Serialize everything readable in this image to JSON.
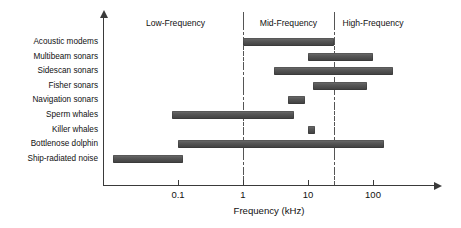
{
  "chart_data": {
    "type": "bar",
    "orientation": "horizontal",
    "title": "",
    "xlabel": "Frequency (kHz)",
    "ylabel": "",
    "xscale": "log",
    "xlim": [
      0.008,
      400
    ],
    "grid": false,
    "legend": null,
    "xticks": [
      0.1,
      1,
      10,
      100
    ],
    "xtick_labels": [
      "0.1",
      "1",
      "10",
      "100"
    ],
    "categories": [
      "Acoustic modems",
      "Multibeam sonars",
      "Sidescan sonars",
      "Fisher sonars",
      "Navigation sonars",
      "Sperm whales",
      "Killer whales",
      "Bottlenose dolphin",
      "Ship-radiated noise"
    ],
    "ranges": [
      {
        "label": "Acoustic modems",
        "start": 1.0,
        "end": 25.0
      },
      {
        "label": "Multibeam sonars",
        "start": 10.0,
        "end": 100.0
      },
      {
        "label": "Sidescan sonars",
        "start": 3.0,
        "end": 200.0
      },
      {
        "label": "Fisher sonars",
        "start": 12.0,
        "end": 80.0
      },
      {
        "label": "Navigation sonars",
        "start": 5.0,
        "end": 9.0
      },
      {
        "label": "Sperm whales",
        "start": 0.08,
        "end": 6.0
      },
      {
        "label": "Killer whales",
        "start": 10.0,
        "end": 13.0
      },
      {
        "label": "Bottlenose dolphin",
        "start": 0.1,
        "end": 150.0
      },
      {
        "label": "Ship-radiated noise",
        "start": 0.01,
        "end": 0.12
      }
    ],
    "bands": [
      {
        "label": "Low-Frequency",
        "start": 0.008,
        "end": 1.0
      },
      {
        "label": "Mid-Frequency",
        "start": 1.0,
        "end": 25.0
      },
      {
        "label": "High-Frequency",
        "start": 25.0,
        "end": 400.0
      }
    ],
    "band_dividers": [
      1.0,
      25.0
    ],
    "bar_color": "#4e4e4e",
    "axis_color": "#3a3a3a"
  }
}
